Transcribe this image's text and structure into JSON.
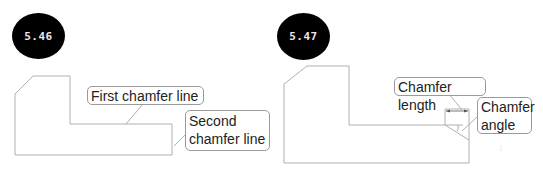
{
  "figures": [
    {
      "number": "5.46",
      "callouts": [
        {
          "text": "First chamfer line"
        },
        {
          "line1": "Second",
          "line2": "chamfer line"
        }
      ]
    },
    {
      "number": "5.47",
      "callouts": [
        {
          "text": "Chamfer length"
        },
        {
          "line1": "Chamfer",
          "line2": "angle"
        }
      ]
    }
  ],
  "colors": {
    "outline": "#b0b0b0",
    "badge_bg": "#000000",
    "badge_text": "#e8e8e8",
    "callout_border": "#9a9a9a"
  }
}
